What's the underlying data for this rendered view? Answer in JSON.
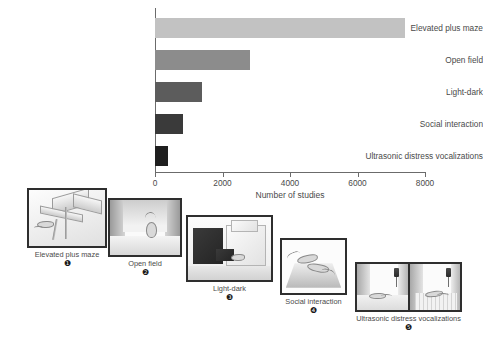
{
  "chart_data": {
    "type": "bar",
    "orientation": "horizontal",
    "title": "",
    "xlabel": "Number of studies",
    "ylabel": "",
    "xlim": [
      0,
      8000
    ],
    "xticks": [
      0,
      2000,
      4000,
      6000,
      8000
    ],
    "xtick_labels": [
      "0",
      "2000",
      "4000",
      "6000",
      "8000"
    ],
    "grid": false,
    "legend": "none",
    "categories": [
      "Elevated plus maze",
      "Open field",
      "Light-dark",
      "Social interaction",
      "Ultrasonic distress vocalizations"
    ],
    "values": [
      7400,
      2800,
      1400,
      830,
      390
    ],
    "bar_colors": [
      "#c2c2c2",
      "#8c8c8c",
      "#5c5c5c",
      "#3a3a3a",
      "#1f1f1f"
    ]
  },
  "axis": {
    "x_label": "Number of studies",
    "ticks": [
      {
        "label": "0",
        "value": 0
      },
      {
        "label": "2000",
        "value": 2000
      },
      {
        "label": "4000",
        "value": 4000
      },
      {
        "label": "6000",
        "value": 6000
      },
      {
        "label": "8000",
        "value": 8000
      }
    ]
  },
  "bars": [
    {
      "label": "Elevated plus maze",
      "value": 7400,
      "color": "#c2c2c2"
    },
    {
      "label": "Open field",
      "value": 2800,
      "color": "#8c8c8c"
    },
    {
      "label": "Light-dark",
      "value": 1400,
      "color": "#5c5c5c"
    },
    {
      "label": "Social interaction",
      "value": 830,
      "color": "#3a3a3a"
    },
    {
      "label": "Ultrasonic distress vocalizations",
      "value": 390,
      "color": "#1f1f1f"
    }
  ],
  "panels": [
    {
      "caption": "Elevated plus maze",
      "number": "❶"
    },
    {
      "caption": "Open field",
      "number": "❷"
    },
    {
      "caption": "Light-dark",
      "number": "❸"
    },
    {
      "caption": "Social interaction",
      "number": "❹"
    },
    {
      "caption": "Ultrasonic distress vocalizations",
      "number": "❺"
    }
  ]
}
